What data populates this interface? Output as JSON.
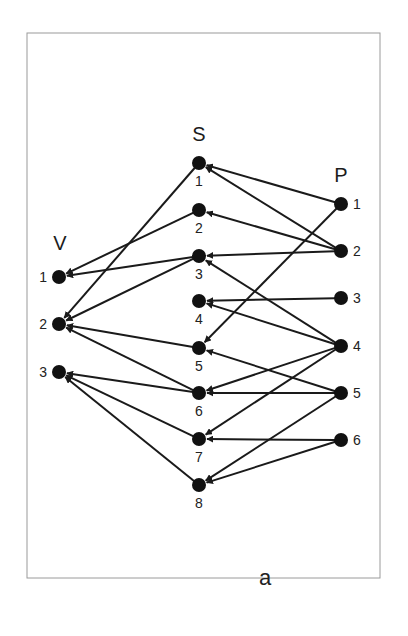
{
  "figure": {
    "caption": "a",
    "frame": {
      "x": 27,
      "y": 33,
      "width": 353,
      "height": 545,
      "color": "#9a9a9a"
    },
    "colors": {
      "node": "#111111",
      "edge": "#1a1a1a",
      "text": "#222222"
    },
    "groups": [
      {
        "id": "V",
        "title": "V",
        "title_pos": [
          60,
          250
        ],
        "label_side": "left",
        "nodes": [
          {
            "id": "V1",
            "label": "1",
            "x": 59,
            "y": 277
          },
          {
            "id": "V2",
            "label": "2",
            "x": 59,
            "y": 324
          },
          {
            "id": "V3",
            "label": "3",
            "x": 59,
            "y": 372
          }
        ]
      },
      {
        "id": "S",
        "title": "S",
        "title_pos": [
          199,
          141
        ],
        "label_side": "below",
        "nodes": [
          {
            "id": "S1",
            "label": "1",
            "x": 199,
            "y": 163
          },
          {
            "id": "S2",
            "label": "2",
            "x": 199,
            "y": 210
          },
          {
            "id": "S3",
            "label": "3",
            "x": 199,
            "y": 256
          },
          {
            "id": "S4",
            "label": "4",
            "x": 199,
            "y": 301
          },
          {
            "id": "S5",
            "label": "5",
            "x": 199,
            "y": 348
          },
          {
            "id": "S6",
            "label": "6",
            "x": 199,
            "y": 393
          },
          {
            "id": "S7",
            "label": "7",
            "x": 199,
            "y": 439
          },
          {
            "id": "S8",
            "label": "8",
            "x": 199,
            "y": 485
          }
        ]
      },
      {
        "id": "P",
        "title": "P",
        "title_pos": [
          341,
          182
        ],
        "label_side": "right",
        "nodes": [
          {
            "id": "P1",
            "label": "1",
            "x": 341,
            "y": 204
          },
          {
            "id": "P2",
            "label": "2",
            "x": 341,
            "y": 251
          },
          {
            "id": "P3",
            "label": "3",
            "x": 341,
            "y": 298
          },
          {
            "id": "P4",
            "label": "4",
            "x": 341,
            "y": 346
          },
          {
            "id": "P5",
            "label": "5",
            "x": 341,
            "y": 393
          },
          {
            "id": "P6",
            "label": "6",
            "x": 341,
            "y": 440
          }
        ]
      }
    ],
    "edges": [
      {
        "from": "P1",
        "to": "S1"
      },
      {
        "from": "P1",
        "to": "S5"
      },
      {
        "from": "P2",
        "to": "S1"
      },
      {
        "from": "P2",
        "to": "S2"
      },
      {
        "from": "P2",
        "to": "S3"
      },
      {
        "from": "P3",
        "to": "S4"
      },
      {
        "from": "P4",
        "to": "S3"
      },
      {
        "from": "P4",
        "to": "S4"
      },
      {
        "from": "P4",
        "to": "S6"
      },
      {
        "from": "P4",
        "to": "S7"
      },
      {
        "from": "P5",
        "to": "S5"
      },
      {
        "from": "P5",
        "to": "S6"
      },
      {
        "from": "P5",
        "to": "S8"
      },
      {
        "from": "P6",
        "to": "S7"
      },
      {
        "from": "P6",
        "to": "S8"
      },
      {
        "from": "S1",
        "to": "V2"
      },
      {
        "from": "S2",
        "to": "V1"
      },
      {
        "from": "S3",
        "to": "V1"
      },
      {
        "from": "S3",
        "to": "V2"
      },
      {
        "from": "S5",
        "to": "V2"
      },
      {
        "from": "S6",
        "to": "V2"
      },
      {
        "from": "S6",
        "to": "V3"
      },
      {
        "from": "S7",
        "to": "V3"
      },
      {
        "from": "S8",
        "to": "V3"
      }
    ],
    "caption_pos": [
      265,
      585
    ]
  }
}
